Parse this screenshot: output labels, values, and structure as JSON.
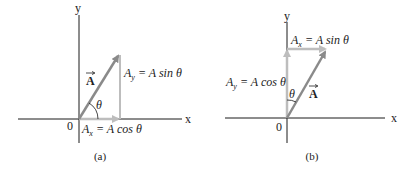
{
  "colors": {
    "axis": "#1a1a1a",
    "vector": "#8a8a8a",
    "component": "#bdbdbd",
    "text": "#222222"
  },
  "panel_a": {
    "caption": "(a)",
    "axis_x_label": "x",
    "axis_y_label": "y",
    "origin_label": "0",
    "vector_label": "A",
    "angle_label": "θ",
    "ax_label": {
      "base": "A",
      "sub": "x",
      "rest": " = A cos θ"
    },
    "ay_label": {
      "base": "A",
      "sub": "y",
      "rest": " = A sin θ"
    }
  },
  "panel_b": {
    "caption": "(b)",
    "axis_x_label": "x",
    "axis_y_label": "y",
    "origin_label": "0",
    "vector_label": "A",
    "angle_label": "θ",
    "ax_label": {
      "base": "A",
      "sub": "x",
      "rest": " = A sin θ"
    },
    "ay_label": {
      "base": "A",
      "sub": "y",
      "rest": " = A cos θ"
    }
  }
}
